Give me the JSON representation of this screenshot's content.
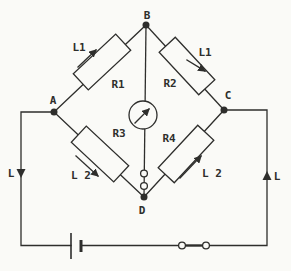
{
  "diagram": {
    "colors": {
      "background": "#fafaf7",
      "line": "#2e2e2c"
    },
    "nodes": {
      "top": "B",
      "left": "A",
      "right": "C",
      "bottom": "D"
    },
    "resistors": {
      "r1": "R1",
      "r2": "R2",
      "r3": "R3",
      "r4": "R4"
    },
    "annotations": {
      "l1_left": "L1",
      "l1_right": "L1",
      "l2_left": "L 2",
      "l2_right": "L 2",
      "current_left": "L",
      "current_right": "L"
    },
    "components": {
      "galvanometer": "galvanometer",
      "battery": "battery-cell",
      "switch": "plug-key-switch-closed"
    }
  }
}
